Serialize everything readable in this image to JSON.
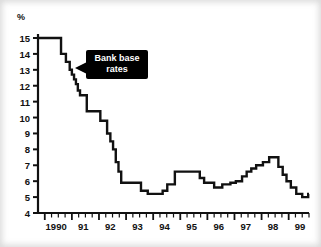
{
  "chart_data": {
    "type": "line",
    "title": "",
    "annotation": "Bank base rates",
    "annotation_lines": [
      "Bank base",
      "rates"
    ],
    "xlabel": "",
    "ylabel": "%",
    "unit": "%",
    "ylim": [
      4,
      15
    ],
    "xlim": [
      1989.75,
      1999.75
    ],
    "grid": false,
    "legend": false,
    "line_color": "#111111",
    "background_color": "#ffffff",
    "annotation_bg": "#000000",
    "annotation_fg": "#ffffff",
    "step_style": "post",
    "y_ticks": [
      4,
      5,
      6,
      7,
      8,
      9,
      10,
      11,
      12,
      13,
      14,
      15
    ],
    "y_tick_labels": [
      "4",
      "5",
      "6",
      "7",
      "8",
      "9",
      "10",
      "11",
      "12",
      "13",
      "14",
      "15"
    ],
    "x_ticks": [
      1990,
      1991,
      1992,
      1993,
      1994,
      1995,
      1996,
      1997,
      1998,
      1999
    ],
    "x_tick_labels": [
      "1990",
      "91",
      "92",
      "93",
      "94",
      "95",
      "96",
      "97",
      "98",
      "99"
    ],
    "minor_ticks_per_year": 4,
    "series": [
      {
        "name": "Bank base rates",
        "x": [
          1989.75,
          1990.6,
          1990.78,
          1990.92,
          1991.0,
          1991.08,
          1991.15,
          1991.22,
          1991.3,
          1991.55,
          1991.78,
          1992.05,
          1992.3,
          1992.42,
          1992.52,
          1992.62,
          1992.72,
          1992.82,
          1993.2,
          1993.55,
          1993.8,
          1994.18,
          1994.35,
          1994.52,
          1994.8,
          1995.1,
          1995.45,
          1995.72,
          1995.88,
          1996.05,
          1996.25,
          1996.55,
          1996.85,
          1997.05,
          1997.28,
          1997.45,
          1997.62,
          1997.8,
          1998.05,
          1998.28,
          1998.48,
          1998.62,
          1998.78,
          1998.92,
          1999.08,
          1999.28,
          1999.5,
          1999.72
        ],
        "y": [
          15.0,
          14.0,
          13.5,
          13.0,
          12.7,
          12.4,
          12.1,
          11.7,
          11.4,
          10.4,
          10.4,
          9.8,
          9.0,
          8.5,
          8.0,
          7.2,
          6.6,
          5.9,
          5.9,
          5.4,
          5.2,
          5.2,
          5.4,
          5.8,
          6.6,
          6.6,
          6.6,
          6.2,
          5.9,
          5.9,
          5.6,
          5.8,
          5.9,
          6.0,
          6.3,
          6.6,
          6.8,
          7.0,
          7.2,
          7.5,
          7.5,
          6.9,
          6.4,
          6.0,
          5.6,
          5.2,
          5.0,
          5.2
        ]
      }
    ]
  }
}
